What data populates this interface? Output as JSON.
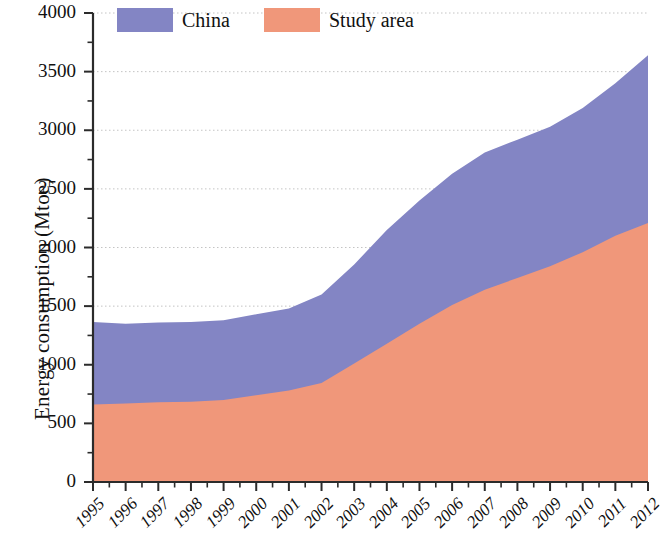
{
  "chart_data": {
    "type": "area",
    "stacked": true,
    "title": "",
    "subtitle": "",
    "xlabel": "",
    "ylabel": "Energy consumption (Mtoe)",
    "x": [
      1995,
      1996,
      1997,
      1998,
      1999,
      2000,
      2001,
      2002,
      2003,
      2004,
      2005,
      2006,
      2007,
      2008,
      2009,
      2010,
      2011,
      2012
    ],
    "categories": [
      "1995",
      "1996",
      "1997",
      "1998",
      "1999",
      "2000",
      "2001",
      "2002",
      "2003",
      "2004",
      "2005",
      "2006",
      "2007",
      "2008",
      "2009",
      "2010",
      "2011",
      "2012"
    ],
    "series": [
      {
        "name": "Study area",
        "color": "#f0977a",
        "values": [
          660,
          670,
          680,
          685,
          700,
          740,
          780,
          845,
          1010,
          1180,
          1350,
          1510,
          1640,
          1740,
          1840,
          1960,
          2100,
          2210
        ]
      },
      {
        "name": "China",
        "color": "#8385c4",
        "values": [
          705,
          680,
          680,
          680,
          680,
          690,
          700,
          755,
          845,
          970,
          1050,
          1120,
          1170,
          1180,
          1190,
          1230,
          1300,
          1430
        ]
      }
    ],
    "totals": [
      1365,
      1350,
      1360,
      1365,
      1380,
      1430,
      1480,
      1600,
      1855,
      2150,
      2400,
      2630,
      2810,
      2920,
      3030,
      3190,
      3400,
      3640
    ],
    "xlim": [
      1995,
      2012
    ],
    "ylim": [
      0,
      4000
    ],
    "ytick_step": 500,
    "ytick_minor_step": 250,
    "yticks": [
      "0",
      "500",
      "1000",
      "1500",
      "2000",
      "2500",
      "3000",
      "3500",
      "4000"
    ],
    "grid": "horizontal-major-dotted",
    "grid_color": "#bdbdbd",
    "legend_position": "top-center"
  },
  "legend": {
    "entries": [
      {
        "label": "China",
        "color": "#8385c4"
      },
      {
        "label": "Study area",
        "color": "#f0977a"
      }
    ]
  },
  "axes": {
    "y_title": "Energy consumption (Mtoe)",
    "axis_color": "#2b2b2b"
  }
}
